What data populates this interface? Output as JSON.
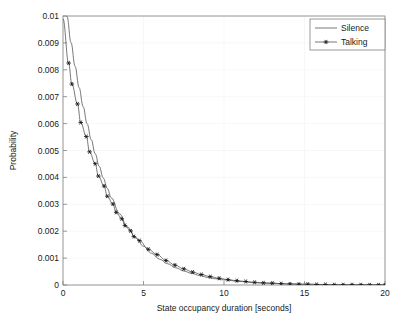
{
  "chart_data": {
    "type": "line",
    "title": "",
    "xlabel": "State occupancy duration [seconds]",
    "ylabel": "Probability",
    "xlim": [
      0,
      20
    ],
    "ylim": [
      0,
      0.01
    ],
    "grid": true,
    "legend_position": "top-right",
    "xticks": [
      "0",
      "5",
      "10",
      "15",
      "20"
    ],
    "xtick_values": [
      0,
      5,
      10,
      15,
      20
    ],
    "yticks": [
      "0",
      "0.001",
      "0.002",
      "0.003",
      "0.004",
      "0.005",
      "0.006",
      "0.007",
      "0.008",
      "0.009",
      "0.01"
    ],
    "ytick_values": [
      0,
      0.001,
      0.002,
      0.003,
      0.004,
      0.005,
      0.006,
      0.007,
      0.008,
      0.009,
      0.01
    ],
    "series": [
      {
        "name": "Silence",
        "marker": "none",
        "color": "#555555",
        "x": [
          0,
          0.25,
          0.5,
          0.75,
          1,
          1.25,
          1.5,
          1.75,
          2,
          2.25,
          2.5,
          2.75,
          3,
          3.5,
          4,
          4.5,
          5,
          5.5,
          6,
          6.5,
          7,
          7.5,
          8,
          8.5,
          9,
          9.5,
          10,
          11,
          12,
          13,
          14,
          15,
          16,
          17,
          18,
          19,
          20
        ],
        "y": [
          0.0112,
          0.00998,
          0.00901,
          0.00813,
          0.00734,
          0.00663,
          0.00599,
          0.00541,
          0.00488,
          0.00441,
          0.00398,
          0.00359,
          0.00324,
          0.00265,
          0.00216,
          0.00177,
          0.00144,
          0.00118,
          0.00096,
          0.00079,
          0.00064,
          0.00052,
          0.00043,
          0.00035,
          0.00028,
          0.00023,
          0.00019,
          0.00013,
          8e-05,
          6e-05,
          4e-05,
          3e-05,
          2e-05,
          1e-05,
          1e-05,
          1e-05,
          5e-06
        ]
      },
      {
        "name": "Talking",
        "marker": "asterisk",
        "color": "#555555",
        "marker_interval": 0.55,
        "x": [
          0,
          0.35,
          0.55,
          0.9,
          1.1,
          1.45,
          1.65,
          2,
          2.2,
          2.55,
          2.75,
          3.1,
          3.3,
          3.65,
          3.85,
          4.2,
          4.4,
          4.75,
          5.3,
          5.85,
          6.4,
          6.95,
          7.5,
          8.05,
          8.6,
          9.15,
          9.7,
          10.25,
          10.8,
          11.35,
          11.9,
          12.45,
          13,
          13.55,
          14.1,
          14.65,
          15.2,
          15.75,
          16.3,
          16.85,
          17.4,
          17.95,
          18.5,
          19.05,
          19.6,
          20
        ],
        "y": [
          0.0099,
          0.00825,
          0.00747,
          0.00673,
          0.00604,
          0.00552,
          0.00495,
          0.00451,
          0.00405,
          0.00368,
          0.0033,
          0.00301,
          0.0027,
          0.00246,
          0.00221,
          0.00201,
          0.0018,
          0.00165,
          0.00133,
          0.00113,
          0.00091,
          0.00074,
          0.0006,
          0.00048,
          0.00039,
          0.00031,
          0.00025,
          0.0002,
          0.00016,
          0.00013,
          0.0001,
          8e-05,
          7e-05,
          5e-05,
          4e-05,
          3e-05,
          3e-05,
          2e-05,
          2e-05,
          1e-05,
          1e-05,
          1e-05,
          8e-06,
          6e-06,
          5e-06,
          4e-06
        ]
      }
    ]
  },
  "legend": {
    "entries": [
      {
        "label": "Silence",
        "marker": "none"
      },
      {
        "label": "Talking",
        "marker": "asterisk"
      }
    ]
  }
}
